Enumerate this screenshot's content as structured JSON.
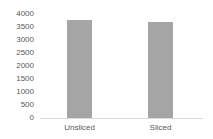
{
  "chart_data": {
    "type": "bar",
    "title": "",
    "xlabel": "",
    "ylabel": "",
    "categories": [
      "Unsliced",
      "Sliced"
    ],
    "values": [
      3780,
      3690
    ],
    "ylim": [
      0,
      4000
    ],
    "yticks": [
      "0",
      "500",
      "1000",
      "1500",
      "2000",
      "2500",
      "3000",
      "3500",
      "4000"
    ],
    "grid": false,
    "legend": null,
    "bar_color": "#a5a5a5"
  }
}
